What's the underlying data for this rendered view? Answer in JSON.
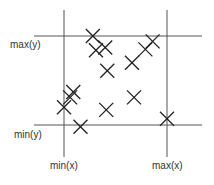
{
  "diagram": {
    "labels": {
      "max_y": "max(y)",
      "min_y": "min(y)",
      "min_x": "min(x)",
      "max_x": "max(x)"
    },
    "colors": {
      "line": "#555555",
      "marker": "#222222",
      "text": "#333333"
    },
    "marker_symbol": "x-cross",
    "bounds": {
      "xmin": 0,
      "xmax": 100,
      "ymin": 0,
      "ymax": 100
    },
    "points": [
      {
        "x": 28,
        "y": 100
      },
      {
        "x": 31,
        "y": 84
      },
      {
        "x": 40,
        "y": 87
      },
      {
        "x": 42,
        "y": 61
      },
      {
        "x": 86,
        "y": 94
      },
      {
        "x": 79,
        "y": 85
      },
      {
        "x": 66,
        "y": 70
      },
      {
        "x": 9,
        "y": 37
      },
      {
        "x": 6,
        "y": 31
      },
      {
        "x": 0,
        "y": 20
      },
      {
        "x": 16,
        "y": -2
      },
      {
        "x": 41,
        "y": 17
      },
      {
        "x": 68,
        "y": 31
      },
      {
        "x": 100,
        "y": 7
      }
    ]
  }
}
